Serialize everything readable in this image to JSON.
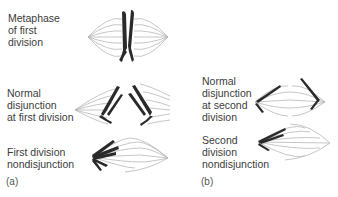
{
  "figure": {
    "panel_a": {
      "letter": "(a)",
      "stages": [
        {
          "id": "metaphase",
          "label": "Metaphase\nof first\ndivision"
        },
        {
          "id": "normal-first",
          "label": "Normal\ndisjunction\nat first division"
        },
        {
          "id": "nondisjunction-first",
          "label": "First division\nnondisjunction"
        }
      ]
    },
    "panel_b": {
      "letter": "(b)",
      "stages": [
        {
          "id": "normal-second",
          "label": "Normal\ndisjunction\nat second\ndivision"
        },
        {
          "id": "nondisjunction-second",
          "label": "Second\ndivision\nnondisjunction"
        }
      ]
    },
    "colors": {
      "spindle": "#b8b8b8",
      "chromosome": "#2a2a2a",
      "text": "#3c3c3c"
    }
  }
}
